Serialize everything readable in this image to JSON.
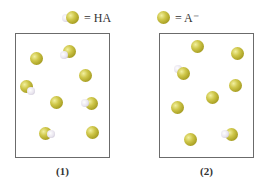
{
  "legend": [
    {
      "species": "HA",
      "label": "= HA",
      "icon": "ha-molecule-icon"
    },
    {
      "species": "A-",
      "label": "= A⁻",
      "icon": "a-minus-ion-icon"
    }
  ],
  "colors": {
    "a_ion": "#c9c044",
    "hydrogen": "#e8e4ee",
    "border": "#6b6b6b"
  },
  "panels": [
    {
      "label": "(1)",
      "ha_count": 4,
      "a_count": 4,
      "particles": [
        {
          "type": "A-",
          "x": 37,
          "y": 59
        },
        {
          "type": "HA",
          "x": 70,
          "y": 52,
          "h": "lower-left"
        },
        {
          "type": "A-",
          "x": 86,
          "y": 76
        },
        {
          "type": "HA",
          "x": 27,
          "y": 87,
          "h": "lower-right"
        },
        {
          "type": "A-",
          "x": 57,
          "y": 103
        },
        {
          "type": "HA",
          "x": 92,
          "y": 104,
          "h": "left"
        },
        {
          "type": "HA",
          "x": 46,
          "y": 134,
          "h": "right"
        },
        {
          "type": "A-",
          "x": 93,
          "y": 133
        }
      ]
    },
    {
      "label": "(2)",
      "ha_count": 2,
      "a_count": 7,
      "particles": [
        {
          "type": "A-",
          "x": 198,
          "y": 47
        },
        {
          "type": "A-",
          "x": 238,
          "y": 54
        },
        {
          "type": "HA",
          "x": 184,
          "y": 74,
          "h": "upper-left"
        },
        {
          "type": "A-",
          "x": 236,
          "y": 86
        },
        {
          "type": "A-",
          "x": 213,
          "y": 98
        },
        {
          "type": "A-",
          "x": 178,
          "y": 108
        },
        {
          "type": "A-",
          "x": 191,
          "y": 140
        },
        {
          "type": "HA",
          "x": 232,
          "y": 135,
          "h": "left"
        }
      ]
    }
  ]
}
